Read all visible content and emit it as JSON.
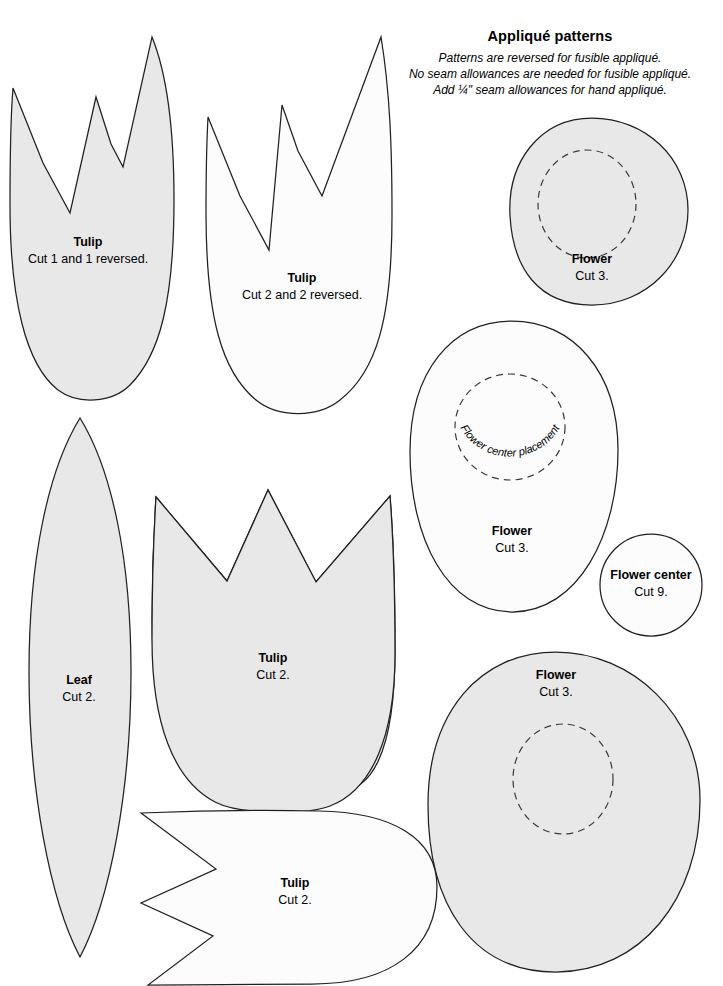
{
  "document": {
    "title": "Appliqué patterns",
    "notes": [
      "Patterns are reversed for fusible appliqué.",
      "No seam allowances are needed for fusible appliqué.",
      "Add ¼\" seam allowances for hand appliqué."
    ]
  },
  "colors": {
    "background": "#ffffff",
    "shape_gray": "#e8e8e8",
    "shape_white": "#fcfcfc",
    "outline": "#231f20",
    "dashed_guide": "#3a3a3a",
    "text": "#000000"
  },
  "patterns": [
    {
      "id": "tulip-1",
      "name": "Tulip",
      "cut": "Cut 1 and 1 reversed.",
      "fill": "gray",
      "label_x": 88,
      "label_y": 246
    },
    {
      "id": "tulip-2",
      "name": "Tulip",
      "cut": "Cut 2 and 2 reversed.",
      "fill": "white",
      "label_x": 302,
      "label_y": 282
    },
    {
      "id": "flower-1",
      "name": "Flower",
      "cut": "Cut 3.",
      "fill": "gray",
      "label_x": 592,
      "label_y": 263
    },
    {
      "id": "flower-2",
      "name": "Flower",
      "cut": "Cut 3.",
      "fill": "white",
      "label_x": 512,
      "label_y": 535,
      "guide_label": "Flower center placement"
    },
    {
      "id": "flower-center",
      "name": "Flower center",
      "cut": "Cut 9.",
      "fill": "white",
      "label_x": 651,
      "label_y": 579
    },
    {
      "id": "leaf",
      "name": "Leaf",
      "cut": "Cut 2.",
      "fill": "gray",
      "label_x": 79,
      "label_y": 684
    },
    {
      "id": "tulip-3",
      "name": "Tulip",
      "cut": "Cut 2.",
      "fill": "gray",
      "label_x": 273,
      "label_y": 662
    },
    {
      "id": "flower-3",
      "name": "Flower",
      "cut": "Cut 3.",
      "fill": "gray",
      "label_x": 556,
      "label_y": 679
    },
    {
      "id": "tulip-4",
      "name": "Tulip",
      "cut": "Cut 2.",
      "fill": "white",
      "label_x": 295,
      "label_y": 887
    }
  ]
}
